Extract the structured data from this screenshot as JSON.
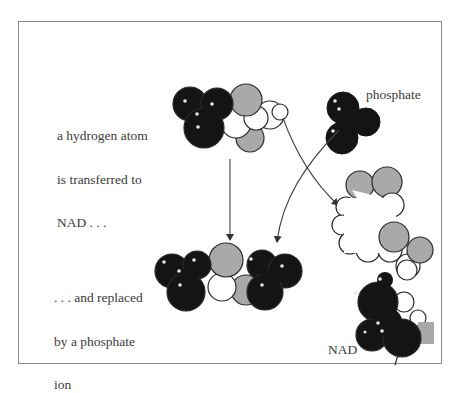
{
  "figure": {
    "captions": {
      "top_left": {
        "lines": [
          "a hydrogen atom",
          "is transferred to",
          "NAD . . ."
        ]
      },
      "bottom_left": {
        "lines": [
          ". . . and replaced",
          "by a phosphate",
          "ion"
        ]
      },
      "phosphate_label": "phosphate",
      "nad_label": "NAD"
    },
    "colors": {
      "black_atom": "#141414",
      "gray_atom": "#a9a9a9",
      "white_atom": "#ffffff",
      "outline": "#2a2a2a",
      "frame": "#8a8a8a",
      "arrow": "#444444",
      "text": "#3a3a3a"
    },
    "elements": [
      {
        "name": "substrate-molecule-top",
        "description": "black, gray and white space-filling atoms before reaction"
      },
      {
        "name": "phosphate-ion",
        "description": "black space-filling phosphate group"
      },
      {
        "name": "product-molecule-bottom",
        "description": "molecule after hydrogen replaced by phosphate"
      },
      {
        "name": "nad-molecule",
        "description": "NAD space-filling model receiving hydrogen"
      },
      {
        "name": "reaction-arrow-down",
        "description": "straight arrow from substrate to product"
      },
      {
        "name": "phosphate-arrow",
        "description": "curved arrow from phosphate to product"
      },
      {
        "name": "hydrogen-transfer-arrow",
        "description": "curved arrow from substrate hydrogen to NAD"
      }
    ]
  }
}
